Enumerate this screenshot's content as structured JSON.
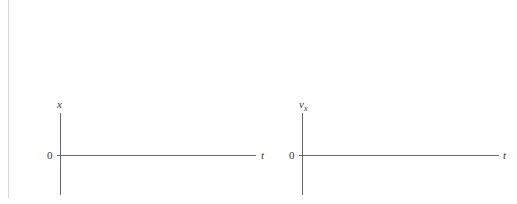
{
  "graphs": [
    {
      "y_label": "x",
      "y_label_sub": "",
      "origin_label": "0",
      "x_label": "t"
    },
    {
      "y_label": "v",
      "y_label_sub": "x",
      "origin_label": "0",
      "x_label": "t"
    }
  ]
}
